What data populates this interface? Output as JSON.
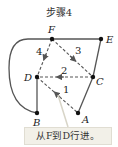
{
  "title": "步骤4",
  "callout": "从F到D行进。",
  "nodes": {
    "F": "F",
    "E": "E",
    "D": "D",
    "C": "C",
    "A": "A",
    "B": "B"
  },
  "edge_labels": {
    "e1": "1",
    "e2": "2",
    "e3": "3",
    "e4": "4"
  },
  "colors": {
    "solid": "#555555",
    "dashed": "#555555",
    "node": "#111111",
    "callout_bg": "#f2f0e8"
  }
}
